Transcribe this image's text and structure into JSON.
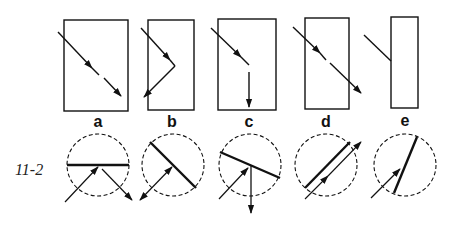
{
  "figure": {
    "number": "11-2",
    "panels": [
      {
        "id": "a",
        "label": "a",
        "description": "partial reflection and transmission"
      },
      {
        "id": "b",
        "label": "b",
        "description": "total reflection"
      },
      {
        "id": "c",
        "label": "c",
        "description": "refraction downward"
      },
      {
        "id": "d",
        "label": "d",
        "description": "transmission straight through"
      },
      {
        "id": "e",
        "label": "e",
        "description": "absorption at surface"
      }
    ]
  },
  "colors": {
    "stroke": "#111111",
    "background": "#ffffff"
  }
}
